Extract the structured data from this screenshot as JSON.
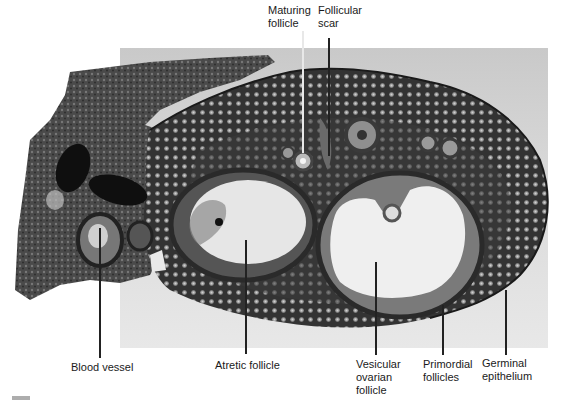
{
  "figure": {
    "type": "labeled light micrograph"
  },
  "labels": {
    "maturing_follicle": "Maturing\nfollicle",
    "follicular_scar": "Follicular\nscar",
    "blood_vessel": "Blood vessel",
    "atretic_follicle": "Atretic follicle",
    "vesicular_ovarian_follicle": "Vesicular\novarian\nfollicle",
    "primordial_follicles": "Primordial\nfollicles",
    "germinal_epithelium": "Germinal\nepithelium"
  },
  "colors": {
    "tissue_dark": "#2b2b2b",
    "tissue_mid": "#5a5a5a",
    "follicle_fluid": "#ececec",
    "background_gray": "#d4d4d4",
    "label_text": "#1a1a1a"
  }
}
